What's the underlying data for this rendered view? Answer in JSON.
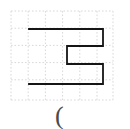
{
  "figure": {
    "canvas": {
      "width": 130,
      "height": 129,
      "background_color": "#ffffff"
    },
    "grid": {
      "name": "dotted-graph-grid",
      "line_color": "#d8d8d8",
      "line_style": "dotted",
      "line_width": 1,
      "cell_size": 17.2,
      "origin_x": 11,
      "origin_y": 11,
      "columns": 6,
      "rows": 5,
      "x_lines": [
        11,
        28.2,
        45.4,
        62.6,
        79.8,
        97,
        113
      ],
      "y_lines": [
        11,
        28.2,
        45.4,
        62.6,
        79.8,
        100
      ]
    },
    "shape": {
      "name": "reversed-e-polygon",
      "label": "Ǝ",
      "stroke_color": "#151515",
      "stroke_width": 1.8,
      "fill": "none",
      "vertices": [
        [
          29,
          29
        ],
        [
          103,
          29
        ],
        [
          103,
          46
        ],
        [
          67,
          46
        ],
        [
          67,
          64
        ],
        [
          103,
          64
        ],
        [
          103,
          84
        ],
        [
          29,
          84
        ]
      ],
      "points_attr": "29,29 103,29 103,46 67,46 67,64 103,64 103,84 29,84"
    },
    "caption": {
      "name": "caption-text",
      "text": "(",
      "color": "#4a4a4a"
    }
  }
}
